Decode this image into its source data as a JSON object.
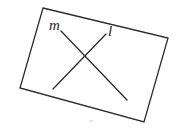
{
  "figure": {
    "type": "geometry-diagram",
    "canvas": {
      "width": 184,
      "height": 140
    },
    "background_color": "#ffffff",
    "stroke_color": "#2b2b2b",
    "label_color": "#1c1c1c",
    "stroke_width": 1.3,
    "quadrilateral": {
      "name": "tilted-rectangle",
      "points": "43,8 168,38 144,122 20,88",
      "corners": [
        {
          "label": "top-left",
          "x": 43,
          "y": 8
        },
        {
          "label": "top-right",
          "x": 168,
          "y": 38
        },
        {
          "label": "bottom-right",
          "x": 144,
          "y": 122
        },
        {
          "label": "bottom-left",
          "x": 20,
          "y": 88
        }
      ]
    },
    "lines": [
      {
        "id": "m",
        "label": "m",
        "x1": 61,
        "y1": 31,
        "x2": 127,
        "y2": 100
      },
      {
        "id": "l",
        "label": "l",
        "x1": 106,
        "y1": 34,
        "x2": 53,
        "y2": 89
      }
    ],
    "intersection": {
      "x": 88,
      "y": 60
    }
  }
}
